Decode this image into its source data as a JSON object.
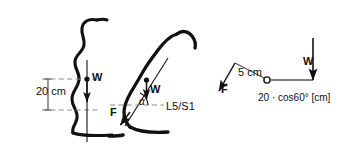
{
  "figure": {
    "title_text": "",
    "colors": {
      "ink": "#111111",
      "dashed_guide": "#8a8a8a",
      "lever_line": "#555555",
      "background": "#ffffff"
    },
    "panel_upright": {
      "name": "upright-posture-spine",
      "dimension_label": "20 cm",
      "weight_label": "W"
    },
    "panel_bent": {
      "name": "bent-posture-spine",
      "weight_label": "W",
      "force_label": "F",
      "angle_label": "α",
      "joint_label": "L5/S1"
    },
    "panel_lever": {
      "name": "free-body-lever-diagram",
      "force_label": "F",
      "force_arm_label": "5 cm",
      "weight_label": "W",
      "weight_arm_label": "20 · cos60° [cm]"
    }
  }
}
